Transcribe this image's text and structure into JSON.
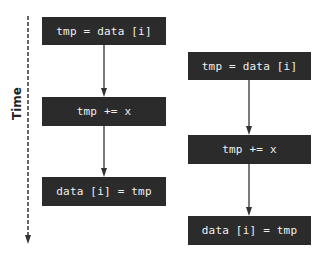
{
  "axis": {
    "label": "Time"
  },
  "thread_a": {
    "steps": [
      "tmp = data [i]",
      "tmp += x",
      "data [i] = tmp"
    ]
  },
  "thread_b": {
    "steps": [
      "tmp = data [i]",
      "tmp += x",
      "data [i] = tmp"
    ]
  },
  "colors": {
    "box_fill": "#2b2b2b",
    "box_text": "#f0f0f0",
    "arrow": "#333333"
  }
}
